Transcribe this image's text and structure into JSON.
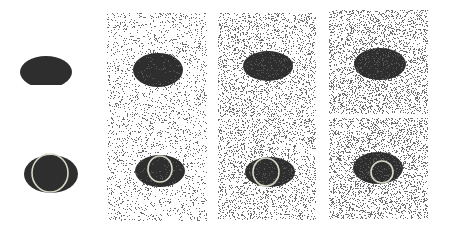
{
  "figure": {
    "colors": {
      "ellipse": "#2e2e2e",
      "background": "#ffffff",
      "noise": "#6a6a6a",
      "contour": "#d8d8c8"
    },
    "rows": [
      {
        "name": "input-row",
        "panels": [
          {
            "noise": 0,
            "x": 15,
            "y": 45,
            "w": 62,
            "h": 40,
            "cx": 46,
            "cy": 72,
            "rx": 26,
            "ry": 16
          },
          {
            "noise": 0.22,
            "x": 107,
            "y": 13,
            "w": 100,
            "h": 106,
            "cx": 158,
            "cy": 70,
            "rx": 25,
            "ry": 17
          },
          {
            "noise": 0.38,
            "x": 218,
            "y": 13,
            "w": 98,
            "h": 104,
            "cx": 268,
            "cy": 66,
            "rx": 25,
            "ry": 15
          },
          {
            "noise": 0.48,
            "x": 329,
            "y": 10,
            "w": 99,
            "h": 104,
            "cx": 380,
            "cy": 64,
            "rx": 26,
            "ry": 16
          }
        ]
      },
      {
        "name": "result-row",
        "panels": [
          {
            "noise": 0,
            "x": 15,
            "y": 150,
            "w": 70,
            "h": 50,
            "cx": 51,
            "cy": 174,
            "rx": 27,
            "ry": 19,
            "ccx": 50,
            "ccy": 173,
            "crx": 18,
            "cry": 19
          },
          {
            "noise": 0.22,
            "x": 107,
            "y": 118,
            "w": 100,
            "h": 103,
            "cx": 160,
            "cy": 171,
            "rx": 25,
            "ry": 16,
            "ccx": 160,
            "ccy": 169,
            "crx": 12,
            "cry": 13
          },
          {
            "noise": 0.38,
            "x": 218,
            "y": 118,
            "w": 98,
            "h": 102,
            "cx": 270,
            "cy": 172,
            "rx": 25,
            "ry": 15,
            "ccx": 266,
            "ccy": 172,
            "crx": 13,
            "cry": 14
          },
          {
            "noise": 0.48,
            "x": 329,
            "y": 118,
            "w": 99,
            "h": 101,
            "cx": 378,
            "cy": 168,
            "rx": 25,
            "ry": 16,
            "ccx": 382,
            "ccy": 172,
            "crx": 11,
            "cry": 11
          }
        ]
      }
    ]
  }
}
